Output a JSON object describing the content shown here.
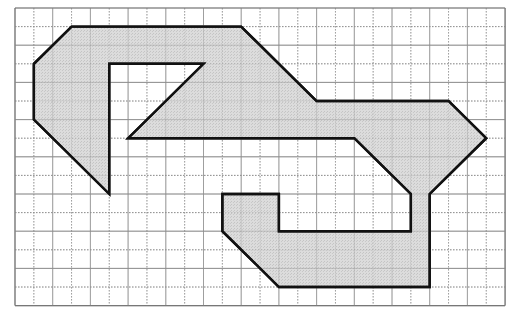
{
  "figure": {
    "grid": {
      "origin_px": [
        15,
        8
      ],
      "cell_w_px": 18.85,
      "cell_h_px": 18.6,
      "columns": 26,
      "rows": 16,
      "line_color": "#9a9a9a",
      "dotted_line_color": "#8a8a8a",
      "border_color": "#777777"
    },
    "shape": {
      "fill_color": "#d9d9d9",
      "stroke_color": "#111111",
      "stroke_width": 2.4,
      "vertices_grid": [
        [
          3,
          1
        ],
        [
          12,
          1
        ],
        [
          16,
          5
        ],
        [
          23,
          5
        ],
        [
          25,
          7
        ],
        [
          22,
          10
        ],
        [
          22,
          15
        ],
        [
          14,
          15
        ],
        [
          11,
          12
        ],
        [
          11,
          10
        ],
        [
          14,
          10
        ],
        [
          14,
          12
        ],
        [
          21,
          12
        ],
        [
          21,
          10
        ],
        [
          18,
          7
        ],
        [
          6,
          7
        ],
        [
          10,
          3
        ],
        [
          5,
          3
        ],
        [
          5,
          10
        ],
        [
          1,
          6
        ],
        [
          1,
          3
        ]
      ]
    }
  }
}
